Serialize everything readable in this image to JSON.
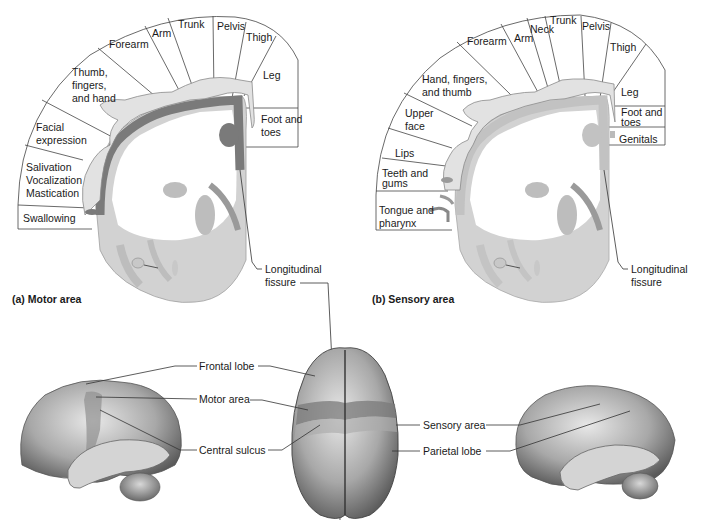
{
  "motor": {
    "caption": "(a) Motor area",
    "labels": {
      "trunk": "Trunk",
      "pelvis": "Pelvis",
      "arm": "Arm",
      "forearm": "Forearm",
      "thigh": "Thigh",
      "thumb1": "Thumb,",
      "thumb2": "fingers,",
      "thumb3": "and hand",
      "leg": "Leg",
      "foot1": "Foot and",
      "foot2": "toes",
      "facial1": "Facial",
      "facial2": "expression",
      "sal1": "Salivation",
      "sal2": "Vocalization",
      "sal3": "Mastication",
      "swallow": "Swallowing"
    },
    "fissure1": "Longitudinal",
    "fissure2": "fissure"
  },
  "sensory": {
    "caption": "(b) Sensory area",
    "labels": {
      "trunk": "Trunk",
      "neck": "Neck",
      "pelvis": "Pelvis",
      "arm": "Arm",
      "forearm": "Forearm",
      "thigh": "Thigh",
      "hand1": "Hand, fingers,",
      "hand2": "and thumb",
      "leg": "Leg",
      "foot1": "Foot and",
      "foot2": "toes",
      "genitals": "Genitals",
      "upper1": "Upper",
      "upper2": "face",
      "lips": "Lips",
      "teeth1": "Teeth and",
      "teeth2": "gums",
      "tongue1": "Tongue and",
      "tongue2": "pharynx"
    },
    "fissure1": "Longitudinal",
    "fissure2": "fissure"
  },
  "brain": {
    "frontal_lobe": "Frontal lobe",
    "motor_area": "Motor area",
    "central_sulcus": "Central sulcus",
    "sensory_area": "Sensory area",
    "parietal_lobe": "Parietal lobe"
  },
  "colors": {
    "motor_cortex": "#7a7a7a",
    "sensory_cortex": "#c4c4c4",
    "gray_matter": "#cfcfcf",
    "homunculus": "#dcdcdc"
  }
}
